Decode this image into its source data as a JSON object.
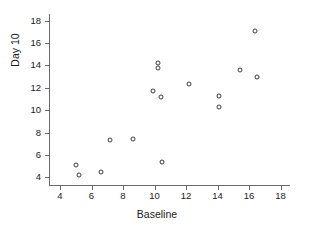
{
  "chart_data": {
    "type": "scatter",
    "title": "",
    "xlabel": "Baseline",
    "ylabel": "Day 10",
    "xlim": [
      3.3,
      18.6
    ],
    "ylim": [
      3.3,
      18.6
    ],
    "grid": false,
    "legend": null,
    "xticks": [
      4,
      6,
      8,
      10,
      12,
      14,
      16,
      18
    ],
    "yticks": [
      4,
      6,
      8,
      10,
      12,
      14,
      16,
      18
    ],
    "xticklabels": [
      "4",
      "6",
      "8",
      "10",
      "12",
      "14",
      "16",
      "18"
    ],
    "yticklabels": [
      "4",
      "6",
      "8",
      "10",
      "12",
      "14",
      "16",
      "18"
    ],
    "marker": "open-circle",
    "marker_color": "#3a3a3a",
    "points": [
      {
        "x": 5.0,
        "y": 5.1
      },
      {
        "x": 5.2,
        "y": 4.2
      },
      {
        "x": 6.6,
        "y": 4.5
      },
      {
        "x": 7.2,
        "y": 7.3
      },
      {
        "x": 8.6,
        "y": 7.4
      },
      {
        "x": 9.9,
        "y": 11.7
      },
      {
        "x": 10.2,
        "y": 14.2
      },
      {
        "x": 10.2,
        "y": 13.8
      },
      {
        "x": 10.4,
        "y": 11.2
      },
      {
        "x": 10.5,
        "y": 5.4
      },
      {
        "x": 12.2,
        "y": 12.3
      },
      {
        "x": 14.1,
        "y": 11.3
      },
      {
        "x": 14.1,
        "y": 10.3
      },
      {
        "x": 15.4,
        "y": 13.6
      },
      {
        "x": 16.4,
        "y": 17.1
      },
      {
        "x": 16.5,
        "y": 13.0
      }
    ]
  }
}
